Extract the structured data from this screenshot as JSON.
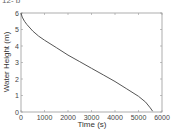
{
  "chart_data": {
    "type": "line",
    "title": "",
    "xlabel": "Time (s)",
    "ylabel": "Water Height (m)",
    "xlim": [
      0,
      6000
    ],
    "ylim": [
      0,
      6
    ],
    "xticks": [
      0,
      1000,
      2000,
      3000,
      4000,
      5000,
      6000
    ],
    "yticks": [
      0,
      1,
      2,
      3,
      4,
      5,
      6
    ],
    "grid": false,
    "legend": null,
    "series": [
      {
        "name": "water height",
        "color": "#555555",
        "x": [
          0,
          50,
          150,
          250,
          500,
          750,
          1000,
          1500,
          2000,
          2500,
          3000,
          3500,
          4000,
          4500,
          5000,
          5300,
          5500,
          5600
        ],
        "y": [
          6.0,
          5.75,
          5.5,
          5.3,
          4.9,
          4.6,
          4.35,
          3.9,
          3.45,
          3.05,
          2.65,
          2.25,
          1.85,
          1.4,
          0.95,
          0.6,
          0.25,
          0.05
        ]
      }
    ]
  },
  "partial_label": "12- b"
}
